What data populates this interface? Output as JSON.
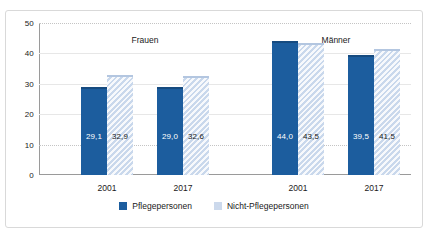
{
  "chart_data": {
    "type": "bar",
    "title": "",
    "xlabel": "",
    "ylabel": "",
    "ylim": [
      0,
      50
    ],
    "yticks": [
      0,
      10,
      20,
      30,
      40,
      50
    ],
    "ytick_labels": [
      "0",
      "10",
      "20",
      "30",
      "40",
      "50"
    ],
    "grid": true,
    "legend_position": "bottom",
    "groups": [
      "Frauen",
      "Männer"
    ],
    "categories": [
      "2001",
      "2017",
      "2001",
      "2017"
    ],
    "series": [
      {
        "name": "Pflegepersonen",
        "color": "#1c5d9e",
        "values": [
          29.1,
          29.0,
          44.0,
          39.5
        ],
        "labels": [
          "29,1",
          "29,0",
          "44,0",
          "39,5"
        ]
      },
      {
        "name": "Nicht-Pflegepersonen",
        "color": "#ccd9ec",
        "values": [
          32.9,
          32.6,
          43.5,
          41.5
        ],
        "labels": [
          "32,9",
          "32,6",
          "43,5",
          "41,5"
        ]
      }
    ]
  },
  "axis": {
    "yticks": [
      {
        "label": "50",
        "value": 50
      },
      {
        "label": "40",
        "value": 40
      },
      {
        "label": "30",
        "value": 30
      },
      {
        "label": "20",
        "value": 20
      },
      {
        "label": "10",
        "value": 10
      },
      {
        "label": "0",
        "value": 0
      }
    ],
    "xticks": [
      {
        "label": "2001"
      },
      {
        "label": "2017"
      },
      {
        "label": "2001"
      },
      {
        "label": "2017"
      }
    ]
  },
  "group_labels": [
    {
      "text": "Frauen"
    },
    {
      "text": "Männer"
    }
  ],
  "legend": {
    "items": [
      {
        "label": "Pflegepersonen",
        "color": "#1c5d9e"
      },
      {
        "label": "Nicht-Pflegepersonen",
        "color": "#ccd9ec"
      }
    ]
  }
}
